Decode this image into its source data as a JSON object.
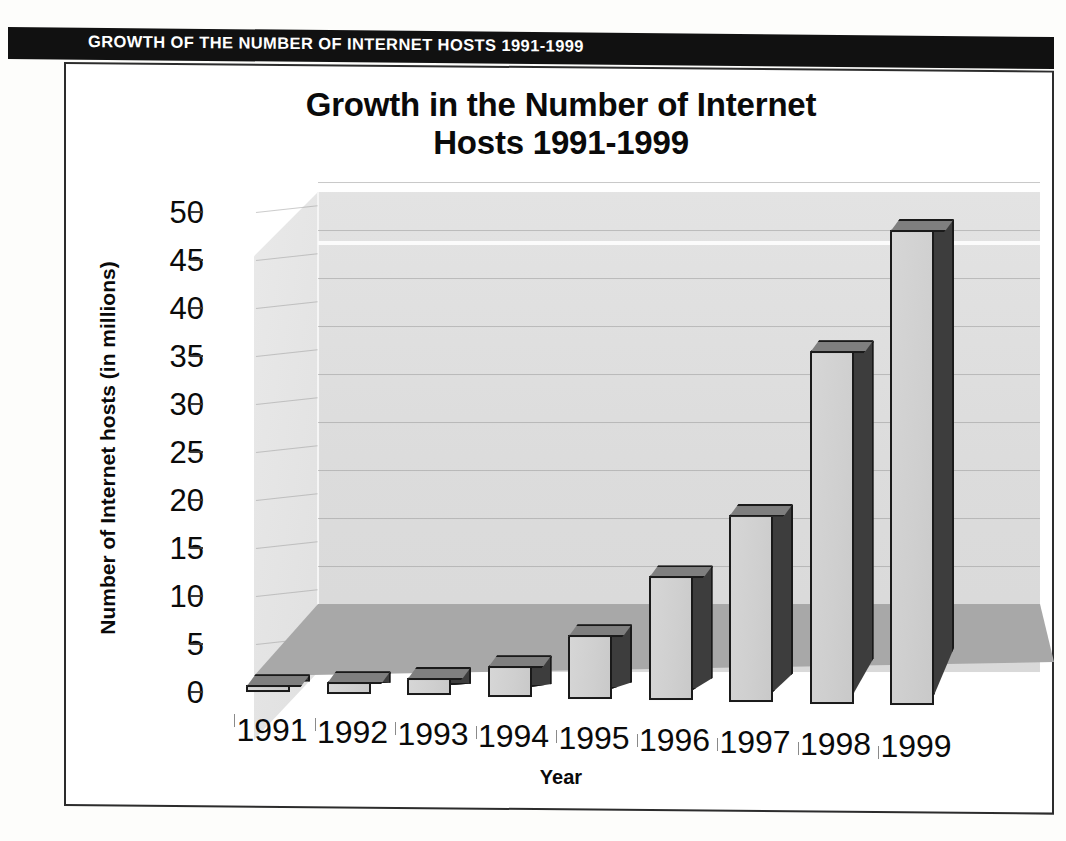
{
  "banner": {
    "text": "GROWTH OF THE NUMBER OF INTERNET HOSTS 1991-1999",
    "background_color": "#111111",
    "text_color": "#ffffff"
  },
  "chart_data": {
    "type": "bar",
    "title": "Growth in the Number of Internet Hosts 1991-1999",
    "title_line1": "Growth in the Number of Internet",
    "title_line2": "Hosts  1991-1999",
    "xlabel": "Year",
    "ylabel": "Number of Internet hosts (in millions)",
    "categories": [
      "1991",
      "1992",
      "1993",
      "1994",
      "1995",
      "1996",
      "1997",
      "1998",
      "1999"
    ],
    "values": [
      0.7,
      1.2,
      1.8,
      3.2,
      6.6,
      12.9,
      19.5,
      36.7,
      49.5
    ],
    "ylim": [
      0,
      50
    ],
    "yticks": [
      0,
      5,
      10,
      15,
      20,
      25,
      30,
      35,
      40,
      45,
      50
    ],
    "ytick_labels": [
      "0",
      "5",
      "10",
      "15",
      "20",
      "25",
      "30",
      "35",
      "40",
      "45",
      "50"
    ],
    "grid": true,
    "legend": "none",
    "style": "3d-column",
    "bar_face_color": "#d0d0d0",
    "bar_side_color": "#3d3d3d",
    "bar_top_color": "#7f7f7f",
    "plot_background_color": "#dcdcdc",
    "floor_color": "#a8a8a8"
  }
}
